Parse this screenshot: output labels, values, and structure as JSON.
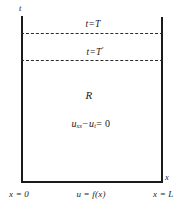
{
  "figure": {
    "colors": {
      "stroke": "#1a1a1a",
      "dash": "#2b2b2b",
      "background": "#ffffff"
    }
  },
  "axes": {
    "vertical_label": "t",
    "horizontal_label": "x"
  },
  "isochrones": [
    {
      "label_t": "t",
      "equals": "=",
      "label_value": "T",
      "prime": "",
      "y": 33
    },
    {
      "label_t": "t",
      "equals": "=",
      "label_value": "T",
      "prime": "′",
      "y": 60
    }
  ],
  "region": {
    "name": "R",
    "pde": {
      "u": "u",
      "sub_xx": "xx",
      "minus": "−",
      "u2": "u",
      "sub_t": "t",
      "equals": "= 0"
    }
  },
  "boundary_conditions": {
    "left": "x = 0",
    "right": "x = L",
    "bottom": "u = f(x)"
  }
}
